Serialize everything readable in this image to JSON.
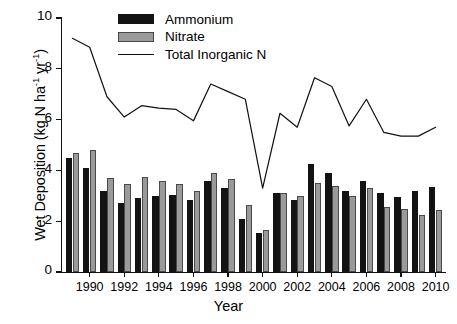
{
  "chart_data": {
    "type": "bar",
    "title": "",
    "subtitle": "",
    "xlabel": "Year",
    "ylabel": "Wet Deposition (kg N ha⁻¹ yr⁻¹)",
    "ylabel_parts": {
      "prefix": "Wet Deposition (kg N ha",
      "sup1": "-1",
      "mid": " yr",
      "sup2": "-1",
      "suffix": ")"
    },
    "grid": false,
    "legend_position": "top-center",
    "ylim": [
      0,
      10
    ],
    "yticks": [
      0,
      2,
      4,
      6,
      8,
      10
    ],
    "ytick_labels": [
      "0",
      "2",
      "4",
      "6",
      "8",
      "10"
    ],
    "xlim": [
      1988.4,
      2010.6
    ],
    "xticks": [
      1990,
      1992,
      1994,
      1996,
      1998,
      2000,
      2002,
      2004,
      2006,
      2008,
      2010
    ],
    "xtick_labels": [
      "1990",
      "1992",
      "1994",
      "1996",
      "1998",
      "2000",
      "2002",
      "2004",
      "2006",
      "2008",
      "2010"
    ],
    "categories": [
      1989,
      1990,
      1991,
      1992,
      1993,
      1994,
      1995,
      1996,
      1997,
      1998,
      1999,
      2000,
      2001,
      2002,
      2003,
      2004,
      2005,
      2006,
      2007,
      2008,
      2009,
      2010
    ],
    "series": [
      {
        "name": "Ammonium",
        "kind": "bar",
        "color": "#131313",
        "values": [
          4.5,
          4.1,
          3.2,
          2.7,
          2.9,
          3.0,
          3.05,
          2.85,
          3.6,
          3.3,
          2.1,
          1.55,
          3.1,
          2.85,
          4.25,
          3.9,
          3.2,
          3.6,
          3.1,
          2.95,
          3.2,
          3.35
        ]
      },
      {
        "name": "Nitrate",
        "kind": "bar",
        "color": "#9a9a9a",
        "values": [
          4.7,
          4.8,
          3.7,
          3.45,
          3.75,
          3.6,
          3.45,
          3.2,
          3.9,
          3.65,
          2.65,
          1.65,
          3.1,
          3.0,
          3.5,
          3.4,
          3.0,
          3.3,
          2.55,
          2.5,
          2.25,
          2.45
        ]
      },
      {
        "name": "Total Inorganic N",
        "kind": "line",
        "color": "#111111",
        "values": [
          9.2,
          8.85,
          6.9,
          6.1,
          6.55,
          6.45,
          6.4,
          5.95,
          7.4,
          7.1,
          6.8,
          3.3,
          6.25,
          5.7,
          7.65,
          7.3,
          5.75,
          6.8,
          5.5,
          5.35,
          5.35,
          5.7
        ]
      }
    ],
    "legend": [
      {
        "label": "Ammonium",
        "swatch": "filled-black"
      },
      {
        "label": "Nitrate",
        "swatch": "filled-gray"
      },
      {
        "label": "Total Inorganic N",
        "swatch": "line"
      }
    ],
    "colors": {
      "ammonium": "#131313",
      "nitrate": "#9a9a9a",
      "line": "#111111",
      "axis": "#111111",
      "background": "#ffffff"
    }
  }
}
